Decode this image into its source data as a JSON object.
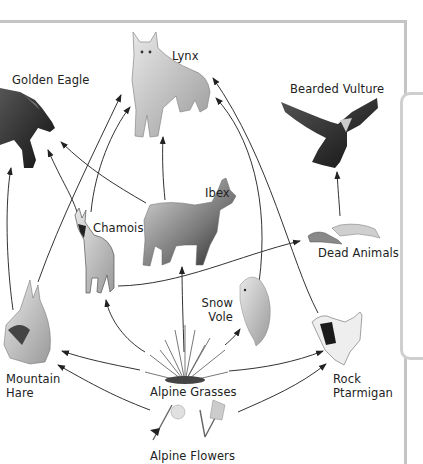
{
  "diagram": {
    "type": "food-web",
    "nodes": [
      {
        "id": "lynx",
        "label": "Lynx",
        "icon": "lynx-icon"
      },
      {
        "id": "golden_eagle",
        "label": "Golden Eagle",
        "icon": "eagle-icon"
      },
      {
        "id": "bearded_vulture",
        "label": "Bearded Vulture",
        "icon": "vulture-icon"
      },
      {
        "id": "ibex",
        "label": "Ibex",
        "icon": "ibex-icon"
      },
      {
        "id": "chamois",
        "label": "Chamois",
        "icon": "chamois-icon"
      },
      {
        "id": "dead_animals",
        "label": "Dead Animals",
        "icon": "carcass-icon"
      },
      {
        "id": "snow_vole",
        "label_lines": [
          "Snow",
          "Vole"
        ],
        "icon": "vole-icon"
      },
      {
        "id": "mountain_hare",
        "label_lines": [
          "Mountain",
          "Hare"
        ],
        "icon": "hare-icon"
      },
      {
        "id": "alpine_grasses",
        "label": "Alpine Grasses",
        "icon": "grass-icon"
      },
      {
        "id": "rock_ptarmigan",
        "label_lines": [
          "Rock",
          "Ptarmigan"
        ],
        "icon": "ptarmigan-icon"
      },
      {
        "id": "alpine_flowers",
        "label": "Alpine Flowers",
        "icon": "flower-icon"
      }
    ],
    "edges": [
      {
        "from": "Alpine Flowers",
        "to": "Mountain Hare"
      },
      {
        "from": "Alpine Flowers",
        "to": "Rock Ptarmigan"
      },
      {
        "from": "Alpine Grasses",
        "to": "Mountain Hare"
      },
      {
        "from": "Alpine Grasses",
        "to": "Chamois"
      },
      {
        "from": "Alpine Grasses",
        "to": "Ibex"
      },
      {
        "from": "Alpine Grasses",
        "to": "Snow Vole"
      },
      {
        "from": "Alpine Grasses",
        "to": "Rock Ptarmigan"
      },
      {
        "from": "Mountain Hare",
        "to": "Golden Eagle"
      },
      {
        "from": "Mountain Hare",
        "to": "Lynx"
      },
      {
        "from": "Chamois",
        "to": "Golden Eagle"
      },
      {
        "from": "Chamois",
        "to": "Lynx"
      },
      {
        "from": "Chamois",
        "to": "Dead Animals"
      },
      {
        "from": "Ibex",
        "to": "Golden Eagle"
      },
      {
        "from": "Ibex",
        "to": "Lynx"
      },
      {
        "from": "Snow Vole",
        "to": "Lynx"
      },
      {
        "from": "Rock Ptarmigan",
        "to": "Lynx"
      },
      {
        "from": "Dead Animals",
        "to": "Bearded Vulture"
      }
    ]
  },
  "labels": {
    "lynx": "Lynx",
    "golden_eagle": "Golden Eagle",
    "bearded_vulture": "Bearded Vulture",
    "ibex": "Ibex",
    "chamois": "Chamois",
    "dead_animals": "Dead Animals",
    "snow_vole_1": "Snow",
    "snow_vole_2": "Vole",
    "mountain_hare_1": "Mountain",
    "mountain_hare_2": "Hare",
    "alpine_grasses": "Alpine Grasses",
    "rock_ptarmigan_1": "Rock",
    "rock_ptarmigan_2": "Ptarmigan",
    "alpine_flowers": "Alpine Flowers"
  },
  "colors": {
    "frame": "#c4c4c4",
    "arrow": "#333333",
    "text": "#222222"
  }
}
